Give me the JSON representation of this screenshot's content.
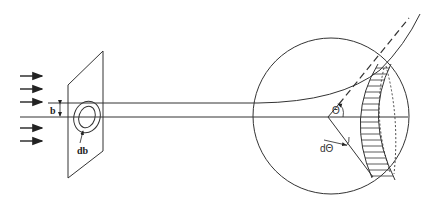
{
  "figure": {
    "labels": {
      "impact_parameter": "b",
      "impact_width": "db",
      "scattering_angle": "Θ",
      "angle_width": "dΘ"
    },
    "incident_arrows": 5,
    "colors": {
      "stroke": "#333333",
      "background": "#ffffff"
    }
  }
}
